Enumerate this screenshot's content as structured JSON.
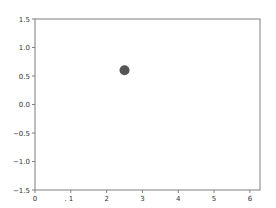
{
  "chart_data": {
    "type": "scatter",
    "title": "",
    "xlabel": "",
    "ylabel": "",
    "xlim": [
      0,
      6.283
    ],
    "ylim": [
      -1.5,
      1.5
    ],
    "grid": false,
    "legend": null,
    "x_ticks": [
      0,
      1,
      2,
      3,
      4,
      5,
      6
    ],
    "x_tick_labels": [
      "0",
      ". 1",
      "2",
      "3",
      "4",
      "5",
      "6"
    ],
    "y_ticks": [
      1.5,
      1.0,
      0.5,
      0.0,
      -0.5,
      -1.0,
      -1.5
    ],
    "y_tick_labels": [
      "1.5",
      "1.0",
      "0.5",
      "0.0",
      "−0.5",
      "−1.0",
      "−1.5"
    ],
    "series": [
      {
        "name": "point",
        "x": [
          2.5
        ],
        "y": [
          0.6
        ],
        "color": "#555555",
        "marker": "circle"
      }
    ]
  },
  "style": {
    "axis_color": "#7f7f7f",
    "tick_label_color": "#333333",
    "point_color": "#555555"
  }
}
